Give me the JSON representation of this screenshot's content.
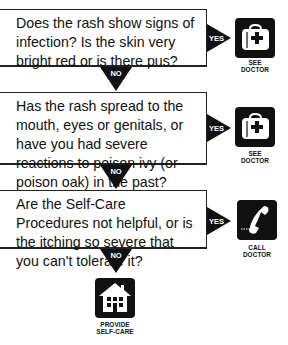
{
  "flowchart": {
    "questions": [
      {
        "text": "Does the rash show signs of infection? Is the skin very bright red or is there pus?",
        "yes_label": "YES",
        "no_label": "NO",
        "outcome": {
          "icon": "doctor-bag-icon",
          "label_line1": "SEE",
          "label_line2": "DOCTOR"
        }
      },
      {
        "text": "Has the rash spread to the mouth, eyes or genitals, or have you had severe reactions to poison ivy (or poison oak) in the past?",
        "yes_label": "YES",
        "no_label": "NO",
        "outcome": {
          "icon": "doctor-bag-icon",
          "label_line1": "SEE",
          "label_line2": "DOCTOR"
        }
      },
      {
        "text": "Are the Self-Care Procedures not helpful, or is the itching so severe that you can't tolerate it?",
        "yes_label": "YES",
        "no_label": "NO",
        "outcome": {
          "icon": "phone-icon",
          "label_line1": "CALL",
          "label_line2": "DOCTOR"
        }
      }
    ],
    "final": {
      "icon": "house-icon",
      "label_line1": "PROVIDE",
      "label_line2": "SELF-CARE"
    },
    "colors": {
      "ink": "#111111",
      "background": "#ffffff"
    }
  }
}
